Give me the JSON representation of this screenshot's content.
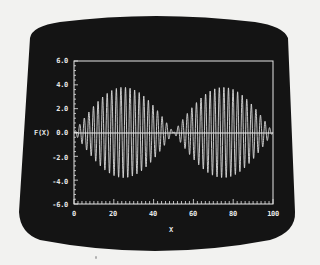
{
  "chart_data": {
    "type": "line",
    "title": "",
    "xlabel": "X",
    "ylabel": "F(X)",
    "xlim": [
      0,
      100
    ],
    "ylim": [
      -6.0,
      6.0
    ],
    "x_ticks": [
      "0",
      "20",
      "40",
      "60",
      "80",
      "100"
    ],
    "y_ticks": [
      "6.0",
      "4.0",
      "2.0",
      "0.0",
      "-2.0",
      "-4.0",
      "-6.0"
    ],
    "grid": false,
    "legend": null,
    "zero_line": true,
    "series": [
      {
        "name": "F(X)",
        "description": "amplitude-modulated (beat) oscillation",
        "formula": "A * sin(2*pi*x/50) * sin(2*pi*x/Pc)",
        "amplitude": 3.8,
        "envelope_period": 100,
        "carrier_period": 2.3,
        "envelope_nulls_x": [
          0,
          50,
          100
        ],
        "envelope_peaks": [
          {
            "x": 25,
            "y": 3.8
          },
          {
            "x": 75,
            "y": 3.8
          }
        ],
        "sample_points": [
          {
            "x": 0,
            "y": 0.0
          },
          {
            "x": 10,
            "y": 2.2
          },
          {
            "x": 25,
            "y": 3.8
          },
          {
            "x": 40,
            "y": 2.2
          },
          {
            "x": 50,
            "y": 0.0
          },
          {
            "x": 60,
            "y": 2.2
          },
          {
            "x": 75,
            "y": 3.8
          },
          {
            "x": 90,
            "y": 2.2
          },
          {
            "x": 100,
            "y": 0.0
          }
        ]
      }
    ]
  },
  "colors": {
    "screen_background": "#141414",
    "trace": "#dcdcdc",
    "axis": "#e6e6e6",
    "bezel_background": "#f2f2f0"
  }
}
